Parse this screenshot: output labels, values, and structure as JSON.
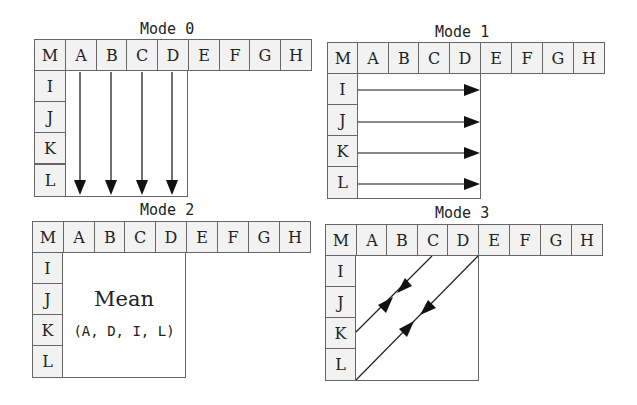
{
  "diagram": {
    "panels": [
      {
        "id": "mode0",
        "title": "Mode 0",
        "header_cells": [
          "M",
          "A",
          "B",
          "C",
          "D",
          "E",
          "F",
          "G",
          "H"
        ],
        "row_cells": [
          "I",
          "J",
          "K",
          "L"
        ],
        "arrow_direction": "down",
        "arrow_columns": [
          "A",
          "B",
          "C",
          "D"
        ]
      },
      {
        "id": "mode1",
        "title": "Mode 1",
        "header_cells": [
          "M",
          "A",
          "B",
          "C",
          "D",
          "E",
          "F",
          "G",
          "H"
        ],
        "row_cells": [
          "I",
          "J",
          "K",
          "L"
        ],
        "arrow_direction": "right",
        "arrow_rows": [
          "I",
          "J",
          "K",
          "L"
        ]
      },
      {
        "id": "mode2",
        "title": "Mode 2",
        "header_cells": [
          "M",
          "A",
          "B",
          "C",
          "D",
          "E",
          "F",
          "G",
          "H"
        ],
        "row_cells": [
          "I",
          "J",
          "K",
          "L"
        ],
        "body_label": "Mean",
        "body_sublabel": "(A, D, I, L)"
      },
      {
        "id": "mode3",
        "title": "Mode 3",
        "header_cells": [
          "M",
          "A",
          "B",
          "C",
          "D",
          "E",
          "F",
          "G",
          "H"
        ],
        "row_cells": [
          "I",
          "J",
          "K",
          "L"
        ],
        "arrow_direction": "diagonal",
        "description": "Diagonal arrows from C-top to K-left and from D-top to L-left, with arrowheads pointing toward each other mid-line"
      }
    ],
    "colors": {
      "line": "#666666",
      "cell_fill": "#f2f2f2",
      "arrow": "#111111",
      "text": "#222222"
    }
  }
}
